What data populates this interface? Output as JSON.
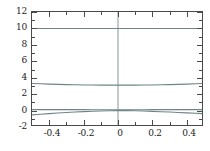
{
  "chart_data": {
    "type": "line",
    "title": "",
    "subtitle": "",
    "xlabel": "",
    "ylabel": "",
    "xlim": [
      -0.5,
      0.5
    ],
    "ylim": [
      -2,
      12
    ],
    "grid": false,
    "legend": null,
    "legend_position": "none",
    "frame": "box",
    "tick_direction": "in",
    "xticks": [
      -0.4,
      -0.2,
      0,
      0.2,
      0.4
    ],
    "xtick_labels": [
      "-0.4",
      "-0.2",
      "0",
      "0.2",
      "0.4"
    ],
    "xticks_minor": [
      -0.3,
      -0.1,
      0.1,
      0.3
    ],
    "yticks": [
      -2,
      0,
      2,
      4,
      6,
      8,
      10,
      12
    ],
    "ytick_labels": [
      "-2",
      "0",
      "2",
      "4",
      "6",
      "8",
      "10",
      "12"
    ],
    "yticks_minor": [
      -1,
      1,
      3,
      5,
      7,
      9,
      11
    ],
    "annotations": [
      {
        "name": "zero-vertical-reference-line",
        "type": "vline",
        "x": 0,
        "color": "#7a8a8a"
      }
    ],
    "line_color": "#6f8585",
    "axis_color": "#4a4a4a",
    "background": "#ffffff",
    "x": [
      -0.5,
      -0.45,
      -0.4,
      -0.35,
      -0.3,
      -0.25,
      -0.2,
      -0.15,
      -0.1,
      -0.05,
      0,
      0.05,
      0.1,
      0.15,
      0.2,
      0.25,
      0.3,
      0.35,
      0.4,
      0.45,
      0.5
    ],
    "series": [
      {
        "name": "curve-1",
        "color": "#6f8585",
        "values": [
          10.0,
          10.0,
          10.0,
          10.0,
          10.0,
          10.0,
          10.0,
          10.0,
          10.0,
          10.0,
          10.0,
          10.0,
          10.0,
          10.0,
          10.0,
          10.0,
          10.0,
          10.0,
          10.0,
          10.0,
          10.0
        ]
      },
      {
        "name": "curve-2",
        "color": "#6f8585",
        "values": [
          3.3,
          3.26,
          3.22,
          3.19,
          3.16,
          3.14,
          3.12,
          3.11,
          3.1,
          3.1,
          3.1,
          3.1,
          3.1,
          3.11,
          3.12,
          3.14,
          3.16,
          3.19,
          3.22,
          3.26,
          3.3
        ]
      },
      {
        "name": "curve-3",
        "color": "#6f8585",
        "values": [
          0.12,
          0.12,
          0.12,
          0.12,
          0.11,
          0.11,
          0.11,
          0.1,
          0.1,
          0.1,
          0.1,
          0.1,
          0.1,
          0.1,
          0.11,
          0.11,
          0.11,
          0.12,
          0.12,
          0.12,
          0.12
        ]
      },
      {
        "name": "curve-4",
        "color": "#6f8585",
        "values": [
          -0.52,
          -0.44,
          -0.37,
          -0.3,
          -0.24,
          -0.18,
          -0.13,
          -0.09,
          -0.05,
          -0.02,
          0.0,
          -0.01,
          -0.03,
          -0.06,
          -0.1,
          -0.14,
          -0.18,
          -0.23,
          -0.28,
          -0.33,
          -0.38
        ]
      }
    ]
  }
}
